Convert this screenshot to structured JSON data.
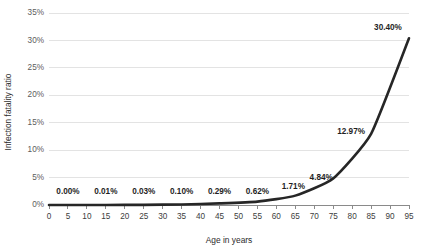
{
  "chart_data": {
    "type": "line",
    "title": "",
    "xlabel": "Age in years",
    "ylabel": "Infection fatality ratio",
    "xlim": [
      0,
      95
    ],
    "ylim": [
      0,
      35
    ],
    "grid": true,
    "legend": false,
    "x_ticks": [
      0,
      5,
      10,
      15,
      20,
      25,
      30,
      35,
      40,
      45,
      50,
      55,
      60,
      65,
      70,
      75,
      80,
      85,
      90,
      95
    ],
    "x_tick_labels": [
      "0",
      "5",
      "10",
      "15",
      "20",
      "25",
      "30",
      "35",
      "40",
      "45",
      "50",
      "55",
      "60",
      "65",
      "70",
      "75",
      "80",
      "85",
      "90",
      "95"
    ],
    "y_ticks": [
      0,
      5,
      10,
      15,
      20,
      25,
      30,
      35
    ],
    "y_tick_labels": [
      "0%",
      "5%",
      "10%",
      "15%",
      "20%",
      "25%",
      "30%",
      "35%"
    ],
    "series": [
      {
        "name": "Infection fatality ratio",
        "color": "#262626",
        "x": [
          5,
          15,
          25,
          35,
          45,
          55,
          65,
          75,
          85,
          95
        ],
        "values": [
          0.0,
          0.01,
          0.03,
          0.1,
          0.29,
          0.62,
          1.71,
          4.84,
          12.97,
          30.4
        ],
        "labels": [
          "0.00%",
          "0.01%",
          "0.03%",
          "0.10%",
          "0.29%",
          "0.62%",
          "1.71%",
          "4.84%",
          "12.97%",
          "30.40%"
        ]
      }
    ]
  },
  "colors": {
    "curve": "#262626",
    "gridline": "#dcdcdc",
    "axis": "#8a8a8a",
    "label_text": "#1f1f1f",
    "tick_text": "#5c5c5c",
    "background": "#ffffff"
  }
}
